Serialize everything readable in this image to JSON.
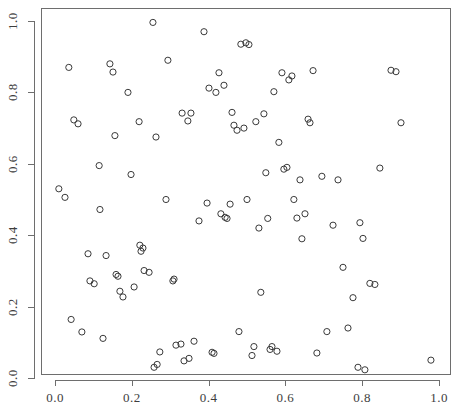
{
  "chart": {
    "type": "scatter",
    "title": "",
    "xlabel": "",
    "ylabel": "",
    "point_symbol": "open-circle",
    "point_color": "#3a3a3a",
    "axis_color": "#6e6e6e",
    "background": "#ffffff"
  },
  "axes": {
    "x_ticks": [
      "0.0",
      "0.2",
      "0.4",
      "0.6",
      "0.8",
      "1.0"
    ],
    "y_ticks": [
      "0.0",
      "0.2",
      "0.4",
      "0.6",
      "0.8",
      "1.0"
    ],
    "x_tick_values": [
      0.0,
      0.2,
      0.4,
      0.6,
      0.8,
      1.0
    ],
    "y_tick_values": [
      0.0,
      0.2,
      0.4,
      0.6,
      0.8,
      1.0
    ]
  },
  "chart_data": {
    "type": "scatter",
    "title": "",
    "xlabel": "",
    "ylabel": "",
    "xlim": [
      -0.02,
      1.04
    ],
    "ylim": [
      -0.02,
      1.03
    ],
    "xticks": [
      0.0,
      0.2,
      0.4,
      0.6,
      0.8,
      1.0
    ],
    "yticks": [
      0.0,
      0.2,
      0.4,
      0.6,
      0.8,
      1.0
    ],
    "grid": false,
    "legend": false,
    "marker": "o",
    "n_points": 114,
    "series": [
      {
        "name": "points",
        "x": [
          0.01,
          0.026,
          0.036,
          0.042,
          0.049,
          0.06,
          0.07,
          0.086,
          0.091,
          0.102,
          0.115,
          0.117,
          0.125,
          0.133,
          0.143,
          0.151,
          0.156,
          0.159,
          0.164,
          0.169,
          0.177,
          0.19,
          0.198,
          0.206,
          0.219,
          0.221,
          0.224,
          0.229,
          0.232,
          0.245,
          0.255,
          0.258,
          0.263,
          0.266,
          0.273,
          0.289,
          0.294,
          0.307,
          0.31,
          0.315,
          0.328,
          0.331,
          0.336,
          0.346,
          0.349,
          0.354,
          0.362,
          0.375,
          0.388,
          0.396,
          0.401,
          0.409,
          0.414,
          0.419,
          0.427,
          0.432,
          0.44,
          0.443,
          0.448,
          0.456,
          0.461,
          0.466,
          0.474,
          0.479,
          0.484,
          0.492,
          0.497,
          0.5,
          0.505,
          0.513,
          0.518,
          0.523,
          0.531,
          0.536,
          0.544,
          0.549,
          0.554,
          0.56,
          0.565,
          0.57,
          0.578,
          0.583,
          0.591,
          0.596,
          0.604,
          0.609,
          0.617,
          0.622,
          0.63,
          0.638,
          0.643,
          0.651,
          0.659,
          0.664,
          0.672,
          0.682,
          0.695,
          0.708,
          0.724,
          0.737,
          0.75,
          0.763,
          0.776,
          0.789,
          0.794,
          0.802,
          0.807,
          0.82,
          0.833,
          0.846,
          0.875,
          0.888,
          0.901,
          0.979
        ],
        "y": [
          0.53,
          0.506,
          0.87,
          0.164,
          0.723,
          0.712,
          0.129,
          0.348,
          0.272,
          0.264,
          0.595,
          0.472,
          0.111,
          0.343,
          0.88,
          0.857,
          0.679,
          0.29,
          0.285,
          0.243,
          0.227,
          0.8,
          0.57,
          0.255,
          0.718,
          0.372,
          0.355,
          0.364,
          0.301,
          0.296,
          0.996,
          0.03,
          0.675,
          0.038,
          0.073,
          0.5,
          0.89,
          0.272,
          0.277,
          0.092,
          0.095,
          0.742,
          0.048,
          0.72,
          0.055,
          0.742,
          0.103,
          0.44,
          0.97,
          0.49,
          0.812,
          0.072,
          0.069,
          0.8,
          0.855,
          0.46,
          0.82,
          0.45,
          0.447,
          0.487,
          0.744,
          0.708,
          0.694,
          0.13,
          0.935,
          0.7,
          0.939,
          0.5,
          0.934,
          0.063,
          0.088,
          0.718,
          0.42,
          0.24,
          0.74,
          0.575,
          0.447,
          0.08,
          0.088,
          0.802,
          0.075,
          0.66,
          0.855,
          0.585,
          0.59,
          0.835,
          0.846,
          0.5,
          0.448,
          0.555,
          0.39,
          0.46,
          0.725,
          0.715,
          0.861,
          0.07,
          0.565,
          0.13,
          0.428,
          0.555,
          0.31,
          0.14,
          0.225,
          0.03,
          0.435,
          0.391,
          0.023,
          0.265,
          0.262,
          0.588,
          0.862,
          0.858,
          0.715,
          0.05
        ]
      }
    ]
  }
}
